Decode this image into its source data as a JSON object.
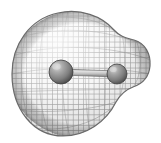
{
  "figure": {
    "name": "molecular-electron-density-isosurface",
    "caption": "",
    "background_color": "#ffffff",
    "render_style": "wireframe-mesh-isosurface",
    "width": 161,
    "height": 143
  },
  "surface": {
    "name": "electron-density-isosurface",
    "mesh_color": "#6e6e6e",
    "mesh_fill_light": "#f2f2f2",
    "mesh_fill_dark": "#bdbdbd",
    "mesh_cell_size": 5,
    "shadow_color": "#9a9a9a",
    "outline": "large rounded lobe enclosing both atoms, wider on the left, with a smaller bulge on the right and shallow notches above and below the right lobe",
    "bounds": {
      "x_min": 12,
      "x_max": 151,
      "y_min": 11,
      "y_max": 137
    }
  },
  "atoms": [
    {
      "label": "atom-large",
      "center_x": 61,
      "center_y": 72,
      "radius": 12,
      "fill_color": "#8c8c8c",
      "highlight_color": "#d0d0d0",
      "shade_color": "#4a4a4a"
    },
    {
      "label": "atom-small",
      "center_x": 117,
      "center_y": 74,
      "radius": 10,
      "fill_color": "#8c8c8c",
      "highlight_color": "#cfcfcf",
      "shade_color": "#4e4e4e"
    }
  ],
  "bond": {
    "label": "bond-cylinder",
    "from_x": 61,
    "from_y": 72,
    "to_x": 117,
    "to_y": 74,
    "thickness": 6,
    "fill_color": "#c9c9c9",
    "edge_color": "#757575"
  }
}
